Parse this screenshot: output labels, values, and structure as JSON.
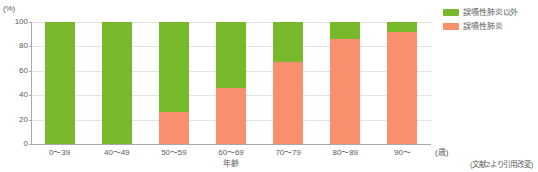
{
  "chart_data": {
    "type": "bar",
    "subtype": "stacked-bar-100-percent",
    "title": "",
    "xlabel": "年齢",
    "xunit": "(歳)",
    "ylabel": "",
    "yunit": "(%)",
    "ylim": [
      0,
      100
    ],
    "yticks": [
      0,
      20,
      40,
      60,
      80,
      100
    ],
    "ytick_labels": [
      "0",
      "20",
      "40",
      "60",
      "80",
      "100"
    ],
    "grid": true,
    "legend_position": "right-top",
    "categories": [
      "0〜39",
      "40〜49",
      "50〜59",
      "60〜69",
      "70〜79",
      "80〜89",
      "90〜"
    ],
    "series": [
      {
        "name": "誤嚥性肺炎以外",
        "color": "#78b82b",
        "values": [
          100,
          100,
          74,
          54,
          33,
          14,
          8
        ]
      },
      {
        "name": "誤嚥性肺炎",
        "color": "#f98f6c",
        "values": [
          0,
          0,
          26,
          46,
          67,
          86,
          92
        ]
      }
    ]
  },
  "legend": {
    "items": [
      {
        "label": "誤嚥性肺炎以外",
        "color": "#78b82b"
      },
      {
        "label": "誤嚥性肺炎",
        "color": "#f98f6c"
      }
    ]
  },
  "footer": {
    "source_note": "(文献2より引用改変)"
  },
  "colors": {
    "green": "#78b82b",
    "orange": "#f98f6c",
    "axis": "#a8a8a8",
    "grid": "#e6e4e0",
    "text": "#5b5b5b",
    "background": "#ffffff"
  }
}
